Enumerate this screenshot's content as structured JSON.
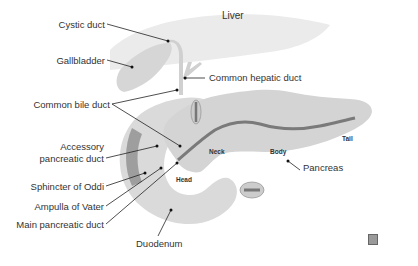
{
  "diagram": {
    "organs": {
      "liver": "Liver",
      "head": "Head",
      "neck": "Neck",
      "body": "Body",
      "tail": "Tail"
    },
    "labels": {
      "cystic_duct": "Cystic duct",
      "gallbladder": "Gallbladder",
      "common_hepatic_duct": "Common hepatic duct",
      "common_bile_duct": "Common bile duct",
      "accessory_pancreatic_duct_1": "Accessory",
      "accessory_pancreatic_duct_2": "pancreatic duct",
      "sphincter_of_oddi": "Sphincter of Oddi",
      "ampulla_of_vater": "Ampulla of Vater",
      "main_pancreatic_duct": "Main pancreatic duct",
      "duodenum": "Duodenum",
      "pancreas": "Pancreas"
    },
    "colors": {
      "organ_fill": "#d9d9d9",
      "organ_light": "#e6e6e6",
      "duct": "#7a7a7a",
      "leader": "#222222",
      "text": "#333333"
    }
  }
}
